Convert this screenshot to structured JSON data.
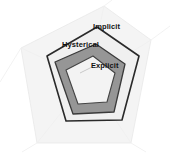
{
  "chart_data": {
    "type": "radar",
    "title": "",
    "subtitle": "",
    "xlabel": "",
    "ylabel": "",
    "grid": true,
    "legend_position": "inline-annotations",
    "axes_count": 5,
    "axis_angles_deg": [
      90,
      162,
      234,
      306,
      18
    ],
    "rmax": 1.0,
    "rlim": [
      0,
      1
    ],
    "center_px": [
      88,
      79
    ],
    "colors": {
      "grid": "#e4e4e4",
      "grid_line": "#ededed",
      "spoke": "#efefef",
      "implicit_fill": "#f0f0f0",
      "implicit_stroke": "#2a2a2a",
      "hysterical_fill": "#969696",
      "hysterical_stroke": "#3a3a3a",
      "explicit_fill": "#f3f3f3",
      "explicit_stroke": "#444444",
      "label_text": "#111111",
      "background": "#ffffff"
    },
    "series": [
      {
        "name": "Implicit",
        "label": "Implicit",
        "label_position": {
          "x": 93,
          "y": 23
        },
        "fill": "#f0f0f0",
        "stroke": "#2a2a2a",
        "values": [
          0.74,
          0.66,
          0.7,
          0.8,
          0.86
        ],
        "points_px": [
          [
            97,
            27
          ],
          [
            47,
            56
          ],
          [
            66,
            121
          ],
          [
            122,
            120
          ],
          [
            139,
            56
          ]
        ]
      },
      {
        "name": "Hysterical",
        "label": "Hysterical",
        "label_position": {
          "x": 62,
          "y": 41
        },
        "fill": "#969696",
        "stroke": "#3a3a3a",
        "values": [
          0.52,
          0.6,
          0.58,
          0.58,
          0.5
        ],
        "points_px": [
          [
            96,
            44
          ],
          [
            55,
            62
          ],
          [
            73,
            114
          ],
          [
            114,
            112
          ],
          [
            125,
            64
          ]
        ]
      },
      {
        "name": "Explicit",
        "label": "Explicit",
        "label_position": {
          "x": 91,
          "y": 62
        },
        "fill": "#f3f3f3",
        "stroke": "#444444",
        "values": [
          0.3,
          0.34,
          0.36,
          0.33,
          0.32
        ],
        "points_px": [
          [
            93,
            56
          ],
          [
            66,
            70
          ],
          [
            78,
            104
          ],
          [
            107,
            102
          ],
          [
            115,
            73
          ]
        ]
      }
    ],
    "grid_rings": [
      {
        "level": 1.0,
        "points_px": [
          [
            104,
            6
          ],
          [
            21,
            48
          ],
          [
            37,
            143
          ],
          [
            131,
            143
          ],
          [
            151,
            40
          ]
        ]
      }
    ],
    "categories": [
      "axis-1",
      "axis-2",
      "axis-3",
      "axis-4",
      "axis-5"
    ],
    "tick_labels": [],
    "annotations": [
      {
        "text": "Implicit",
        "x": 93,
        "y": 23
      },
      {
        "text": "Hysterical",
        "x": 62,
        "y": 41
      },
      {
        "text": "Explicit",
        "x": 91,
        "y": 62
      }
    ]
  },
  "labels": {
    "implicit": "Implicit",
    "hysterical": "Hysterical",
    "explicit": "Explicit"
  }
}
